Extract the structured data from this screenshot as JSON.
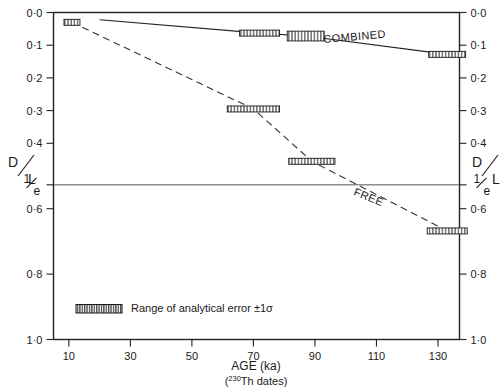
{
  "chart_data": {
    "type": "line",
    "title": "",
    "xlabel": "AGE (ka)",
    "xlabel_sub_pre": "(",
    "xlabel_sub_sup": "230",
    "xlabel_sub_post": "Th dates)",
    "ylabel_numerator": "D",
    "ylabel_denominator": "L",
    "xlim": [
      5,
      137
    ],
    "ylim": [
      0.0,
      1.0
    ],
    "grid": "single horizontal line at 1/e",
    "legend_position": "inside bottom-left",
    "x_ticks": [
      {
        "value": 10,
        "label": "10"
      },
      {
        "value": 30,
        "label": "30"
      },
      {
        "value": 50,
        "label": "50"
      },
      {
        "value": 70,
        "label": "70"
      },
      {
        "value": 90,
        "label": "90"
      },
      {
        "value": 110,
        "label": "110"
      },
      {
        "value": 130,
        "label": "130"
      }
    ],
    "y_ticks": [
      {
        "value": 0.0,
        "label": "0·0"
      },
      {
        "value": 0.1,
        "label": "0·1"
      },
      {
        "value": 0.2,
        "label": "0·2"
      },
      {
        "value": 0.3,
        "label": "0·3"
      },
      {
        "value": 0.4,
        "label": "0·4"
      },
      {
        "value": 0.6,
        "label": "0·6"
      },
      {
        "value": 0.8,
        "label": "0·8"
      },
      {
        "value": 1.0,
        "label": "1·0"
      }
    ],
    "special_y_tick": {
      "value": 0.527,
      "numerator": "1",
      "denominator": "e",
      "gridline": true
    },
    "series": [
      {
        "name": "COMBINED",
        "linestyle": "solid",
        "label_x": 103,
        "label_y": 0.085,
        "label_rotation": -5,
        "points": [
          {
            "x": 20,
            "y": 0.022
          },
          {
            "x": 72,
            "y": 0.063
          },
          {
            "x": 87,
            "y": 0.072
          },
          {
            "x": 133,
            "y": 0.128
          }
        ],
        "error_boxes": [
          {
            "x_center": 72,
            "x_half_width": 6.5,
            "y": 0.063,
            "height": 0.016
          },
          {
            "x_center": 87,
            "x_half_width": 6.0,
            "y": 0.072,
            "height": 0.03
          },
          {
            "x_center": 133,
            "x_half_width": 6.0,
            "y": 0.128,
            "height": 0.016
          }
        ]
      },
      {
        "name": "FREE",
        "linestyle": "dashed",
        "label_x": 107,
        "label_y": 0.575,
        "label_rotation": 22,
        "points": [
          {
            "x": 11,
            "y": 0.03
          },
          {
            "x": 70,
            "y": 0.295
          },
          {
            "x": 89,
            "y": 0.455
          },
          {
            "x": 133,
            "y": 0.668
          }
        ],
        "error_boxes": [
          {
            "x_center": 11,
            "x_half_width": 2.6,
            "y": 0.03,
            "height": 0.016
          },
          {
            "x_center": 70,
            "x_half_width": 8.5,
            "y": 0.295,
            "height": 0.016
          },
          {
            "x_center": 89,
            "x_half_width": 7.5,
            "y": 0.455,
            "height": 0.016
          },
          {
            "x_center": 133,
            "x_half_width": 6.5,
            "y": 0.668,
            "height": 0.016
          }
        ]
      }
    ],
    "legend": {
      "swatch": "hatched-bar",
      "text": "Range of analytical error ±1σ"
    }
  }
}
